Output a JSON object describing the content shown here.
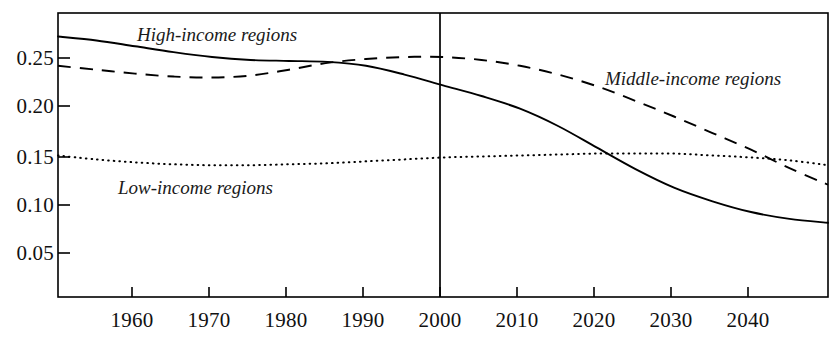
{
  "chart_data": {
    "type": "line",
    "title": "",
    "subtitle": "",
    "xlabel": "",
    "ylabel": "",
    "xlim": [
      1950,
      2050
    ],
    "ylim": [
      0.0,
      0.29
    ],
    "grid": false,
    "legend_position": "inline-annotations",
    "x_ticks": [
      1960,
      1970,
      1980,
      1990,
      2000,
      2010,
      2020,
      2030,
      2040
    ],
    "x_tick_labels": [
      "1960",
      "1970",
      "1980",
      "1990",
      "2000",
      "2010",
      "2020",
      "2030",
      "2040"
    ],
    "y_ticks": [
      0.05,
      0.1,
      0.15,
      0.2,
      0.25
    ],
    "y_tick_labels": [
      "0.05",
      "0.10",
      "0.15",
      "0.20",
      "0.25"
    ],
    "annotations": [
      {
        "text": "High-income regions",
        "x": 1971,
        "y": 0.272,
        "style": "italic"
      },
      {
        "text": "Middle-income regions",
        "x": 2022,
        "y": 0.232,
        "style": "italic"
      },
      {
        "text": "Low-income regions",
        "x": 1968,
        "y": 0.128,
        "style": "italic"
      }
    ],
    "reference_line": {
      "x": 2000,
      "label": "2000",
      "orientation": "vertical"
    },
    "x": [
      1950,
      1955,
      1960,
      1965,
      1970,
      1975,
      1980,
      1985,
      1990,
      1995,
      2000,
      2005,
      2010,
      2015,
      2020,
      2025,
      2030,
      2035,
      2040,
      2045,
      2050
    ],
    "series": [
      {
        "name": "High-income regions",
        "line_style": "solid",
        "color": "#000000",
        "values": [
          0.272,
          0.268,
          0.262,
          0.256,
          0.251,
          0.248,
          0.247,
          0.246,
          0.242,
          0.233,
          0.222,
          0.211,
          0.198,
          0.18,
          0.158,
          0.136,
          0.117,
          0.103,
          0.092,
          0.085,
          0.081
        ]
      },
      {
        "name": "Middle-income regions",
        "line_style": "dashed",
        "color": "#000000",
        "values": [
          0.242,
          0.238,
          0.234,
          0.231,
          0.23,
          0.232,
          0.238,
          0.245,
          0.249,
          0.251,
          0.251,
          0.248,
          0.242,
          0.233,
          0.221,
          0.206,
          0.19,
          0.173,
          0.156,
          0.137,
          0.12
        ]
      },
      {
        "name": "Low-income regions",
        "line_style": "dotted",
        "color": "#000000",
        "values": [
          0.15,
          0.146,
          0.143,
          0.141,
          0.14,
          0.14,
          0.141,
          0.142,
          0.144,
          0.146,
          0.148,
          0.149,
          0.15,
          0.151,
          0.152,
          0.152,
          0.152,
          0.15,
          0.148,
          0.145,
          0.14
        ]
      }
    ]
  },
  "axis": {
    "y_labels": [
      "0.25",
      "0.20",
      "0.15",
      "0.10",
      "0.05"
    ],
    "x_labels": [
      "1960",
      "1970",
      "1980",
      "1990",
      "2000",
      "2010",
      "2020",
      "2030",
      "2040"
    ]
  },
  "labels": {
    "high_income": "High-income regions",
    "middle_income": "Middle-income regions",
    "low_income": "Low-income regions"
  },
  "colors": {
    "axis": "#000000",
    "line": "#000000",
    "background": "#ffffff"
  }
}
